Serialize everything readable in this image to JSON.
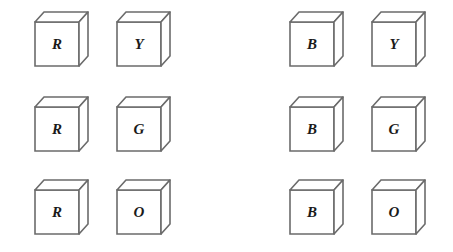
{
  "style": {
    "line_color": "#6b6b6b",
    "letter_color": "#1a1a1a",
    "background": "#ffffff"
  },
  "groups": [
    {
      "name": "left-group",
      "cubes": [
        {
          "id": "r1c1",
          "label": "R",
          "x": 33,
          "y": 10
        },
        {
          "id": "r1c2",
          "label": "Y",
          "x": 115,
          "y": 10
        },
        {
          "id": "r2c1",
          "label": "R",
          "x": 33,
          "y": 95
        },
        {
          "id": "r2c2",
          "label": "G",
          "x": 115,
          "y": 95
        },
        {
          "id": "r3c1",
          "label": "R",
          "x": 33,
          "y": 178
        },
        {
          "id": "r3c2",
          "label": "O",
          "x": 115,
          "y": 178
        }
      ]
    },
    {
      "name": "right-group",
      "cubes": [
        {
          "id": "r1c3",
          "label": "B",
          "x": 288,
          "y": 10
        },
        {
          "id": "r1c4",
          "label": "Y",
          "x": 370,
          "y": 10
        },
        {
          "id": "r2c3",
          "label": "B",
          "x": 288,
          "y": 95
        },
        {
          "id": "r2c4",
          "label": "G",
          "x": 370,
          "y": 95
        },
        {
          "id": "r3c3",
          "label": "B",
          "x": 288,
          "y": 178
        },
        {
          "id": "r3c4",
          "label": "O",
          "x": 370,
          "y": 178
        }
      ]
    }
  ]
}
